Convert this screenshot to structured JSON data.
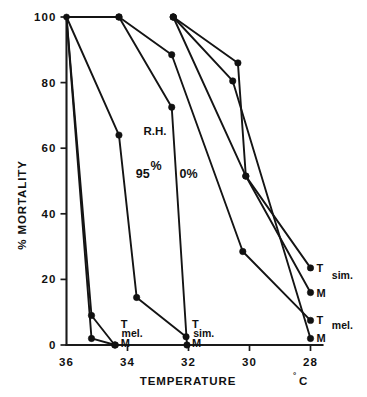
{
  "chart_data": {
    "type": "line",
    "title": "",
    "xlabel": "TEMPERATURE",
    "xlabel_unit": "°C",
    "ylabel": "% MORTALITY",
    "xlim": [
      36,
      28
    ],
    "ylim": [
      0,
      100
    ],
    "x_ticks": [
      36,
      34,
      32,
      30,
      28
    ],
    "x_tick_labels": [
      "36",
      "34",
      "32",
      "30",
      "28"
    ],
    "y_ticks": [
      0,
      20,
      40,
      60,
      80,
      100
    ],
    "y_tick_labels": [
      "0",
      "20",
      "40",
      "60",
      "80",
      "100"
    ],
    "grid": false,
    "legend_position": "none",
    "x_axis_direction": "decreasing",
    "annotations": [
      {
        "name": "rh-label",
        "text": "R.H.",
        "x": 33.1,
        "y": 64
      },
      {
        "name": "rh-95-label",
        "text": "95",
        "x": 33.5,
        "y": 51
      },
      {
        "name": "rh-95-pct",
        "text": "%",
        "x": 33.1,
        "y": 52
      },
      {
        "name": "rh-0-label",
        "text": "0%",
        "x": 32.0,
        "y": 51
      },
      {
        "name": "mel-axis-label",
        "text": "mel.",
        "x": 33.85,
        "y": 2.5
      },
      {
        "name": "sim-axis-label",
        "text": "sim.",
        "x": 31.5,
        "y": 2.5
      },
      {
        "name": "sim-right-label",
        "text": "sim.",
        "x": 27.3,
        "y": 20
      },
      {
        "name": "mel-right-label",
        "text": "mel.",
        "x": 27.3,
        "y": 5
      }
    ],
    "series": [
      {
        "name": "T-mel-95RH",
        "label": "T",
        "species": "mel.",
        "humidity": "95%",
        "points": [
          [
            36,
            100
          ],
          [
            35.18,
            9.0
          ],
          [
            34.42,
            0
          ]
        ]
      },
      {
        "name": "M-mel-95RH",
        "label": "M",
        "species": "mel.",
        "humidity": "95%",
        "points": [
          [
            36,
            100
          ],
          [
            35.18,
            2.0
          ],
          [
            34.4,
            0
          ]
        ]
      },
      {
        "name": "T-sim-95RH",
        "label": "T",
        "species": "sim.",
        "humidity": "95%",
        "points": [
          [
            36,
            100
          ],
          [
            34.28,
            64.0
          ],
          [
            33.7,
            14.5
          ],
          [
            32.08,
            2.5
          ]
        ]
      },
      {
        "name": "M-sim-95RH",
        "label": "M",
        "species": "sim.",
        "humidity": "95%",
        "points": [
          [
            36,
            100
          ],
          [
            34.28,
            100
          ],
          [
            32.55,
            72.5
          ],
          [
            32.05,
            0
          ]
        ]
      },
      {
        "name": "T-mel-0RH",
        "label": "T",
        "species": "mel.",
        "humidity": "0%",
        "points": [
          [
            34.28,
            100
          ],
          [
            32.55,
            88.5
          ],
          [
            30.22,
            28.5
          ],
          [
            28,
            7.5
          ]
        ]
      },
      {
        "name": "M-mel-0RH",
        "label": "M",
        "species": "mel.",
        "humidity": "0%",
        "points": [
          [
            32.5,
            100
          ],
          [
            30.55,
            80.5
          ],
          [
            28,
            2.0
          ]
        ]
      },
      {
        "name": "T-sim-0RH",
        "label": "T",
        "species": "sim.",
        "humidity": "0%",
        "points": [
          [
            32.5,
            100
          ],
          [
            30.38,
            86.0
          ],
          [
            30.12,
            51.5
          ],
          [
            28,
            23.5
          ]
        ]
      },
      {
        "name": "M-sim-0RH",
        "label": "M",
        "species": "sim.",
        "humidity": "0%",
        "points": [
          [
            32.5,
            100
          ],
          [
            30.12,
            51.5
          ],
          [
            28,
            16.0
          ]
        ]
      }
    ],
    "endpoint_labels": [
      {
        "name": "endpoint-t-sim",
        "text": "T",
        "x": 28,
        "y": 23.5
      },
      {
        "name": "endpoint-m-sim",
        "text": "M",
        "x": 28,
        "y": 16.0
      },
      {
        "name": "endpoint-t-mel",
        "text": "T",
        "x": 28,
        "y": 7.5
      },
      {
        "name": "endpoint-m-mel",
        "text": "M",
        "x": 28,
        "y": 2.0
      },
      {
        "name": "axis-t-mel",
        "text": "T",
        "x": 34.42,
        "y": 6.5
      },
      {
        "name": "axis-m-mel",
        "text": "M",
        "x": 34.42,
        "y": 0.5
      },
      {
        "name": "axis-t-sim",
        "text": "T",
        "x": 32.08,
        "y": 6.5
      },
      {
        "name": "axis-m-sim",
        "text": "M",
        "x": 32.08,
        "y": 0.5
      }
    ],
    "colors": {
      "line": "#141414",
      "marker": "#111111",
      "axis": "#1a1a1a",
      "background": "#ffffff"
    }
  }
}
